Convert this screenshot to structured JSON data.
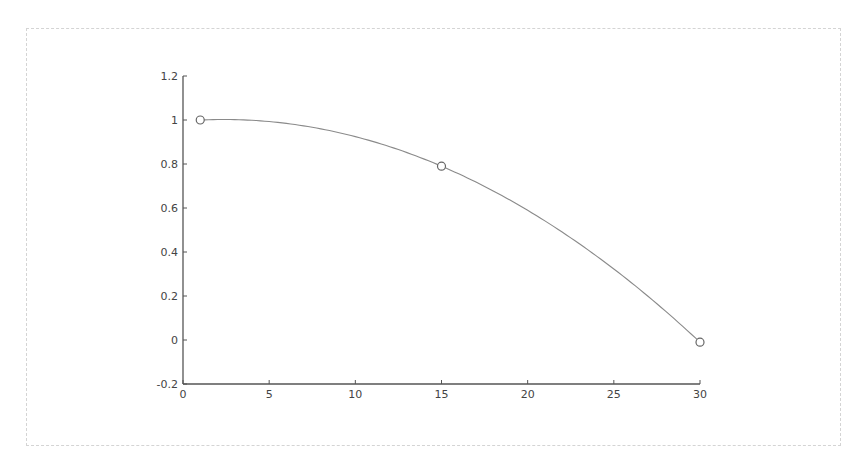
{
  "chart_data": {
    "type": "line",
    "title": "",
    "xlabel": "",
    "ylabel": "",
    "xlim": [
      0,
      30
    ],
    "ylim": [
      -0.2,
      1.2
    ],
    "grid": false,
    "legend": null,
    "x_ticks": [
      0,
      5,
      10,
      15,
      20,
      25,
      30
    ],
    "x_tick_labels": [
      "0",
      "5",
      "10",
      "15",
      "20",
      "25",
      "30"
    ],
    "y_ticks": [
      -0.2,
      0,
      0.2,
      0.4,
      0.6,
      0.8,
      1,
      1.2
    ],
    "y_tick_labels": [
      "-0.2",
      "0",
      "0.2",
      "0.4",
      "0.6",
      "0.8",
      "1",
      "1.2"
    ],
    "series": [
      {
        "name": "data points",
        "style": "markers (open circles)",
        "x": [
          1,
          15,
          30
        ],
        "y": [
          1.0,
          0.79,
          -0.01
        ]
      },
      {
        "name": "interpolated curve",
        "style": "solid line",
        "x": [
          1,
          3,
          5,
          7,
          9,
          11,
          13,
          15,
          17,
          19,
          21,
          23,
          25,
          27,
          29,
          30
        ],
        "y": [
          1.0,
          1.0,
          0.99,
          0.97,
          0.94,
          0.9,
          0.85,
          0.79,
          0.72,
          0.63,
          0.54,
          0.43,
          0.32,
          0.19,
          0.06,
          -0.01
        ]
      }
    ],
    "colors": {
      "line": "#8a8a8a",
      "axis": "#555555",
      "marker": "#666666"
    }
  },
  "plot_area": {
    "left": 183,
    "right": 700,
    "top": 76,
    "bottom": 384
  }
}
